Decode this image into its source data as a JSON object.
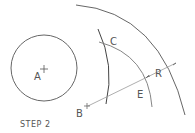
{
  "diagram": {
    "caption": "STEP 2",
    "labels": {
      "a": "A",
      "b": "B",
      "c": "C",
      "e": "E",
      "r": "R"
    },
    "colors": {
      "stroke": "#4a4a4a",
      "construction": "#9a9a9a",
      "text": "#555555"
    }
  }
}
